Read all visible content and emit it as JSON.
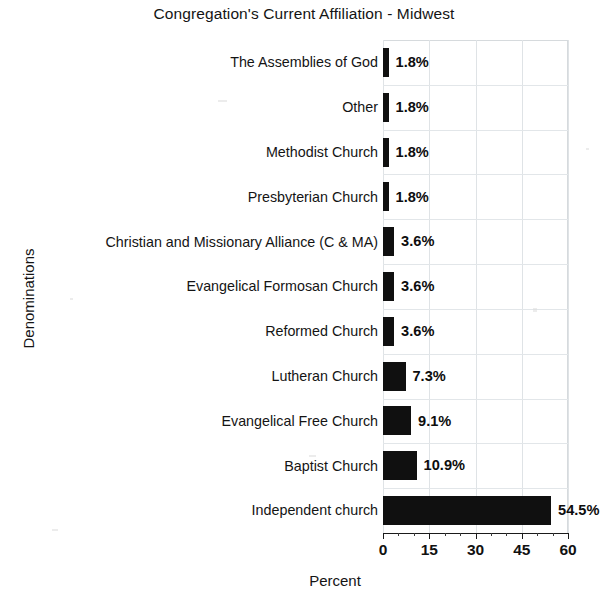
{
  "chart_data": {
    "type": "bar",
    "orientation": "horizontal",
    "title": "Congregation's Current Affiliation - Midwest",
    "xlabel": "Percent",
    "ylabel": "Denominations",
    "xlim": [
      0,
      60
    ],
    "xticks": [
      0,
      15,
      30,
      45,
      60
    ],
    "xtick_labels": [
      "0",
      "15",
      "30",
      "45",
      "60"
    ],
    "minor_tick_interval": 5,
    "grid": true,
    "legend": null,
    "bar_color": "#101010",
    "categories": [
      "The Assemblies of God",
      "Other",
      "Methodist Church",
      "Presbyterian Church",
      "Christian and Missionary Alliance (C & MA)",
      "Evangelical Formosan Church",
      "Reformed Church",
      "Lutheran Church",
      "Evangelical Free Church",
      "Baptist Church",
      "Independent church"
    ],
    "values": [
      1.8,
      1.8,
      1.8,
      1.8,
      3.6,
      3.6,
      3.6,
      7.3,
      9.1,
      10.9,
      54.5
    ],
    "value_labels": [
      "1.8%",
      "1.8%",
      "1.8%",
      "1.8%",
      "3.6%",
      "3.6%",
      "3.6%",
      "7.3%",
      "9.1%",
      "10.9%",
      "54.5%"
    ]
  }
}
